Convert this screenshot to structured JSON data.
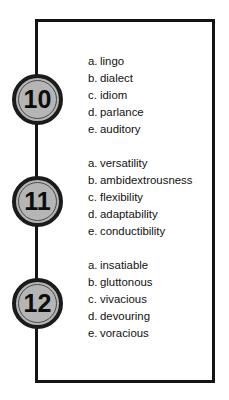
{
  "page": {
    "background_color": "#ffffff",
    "frame_color": "#141414",
    "medallion_fill_color": "#b5b5b5",
    "medallion_ring_color": "#1b1b1b",
    "text_color": "#111111"
  },
  "questions": [
    {
      "number": "10",
      "options": [
        {
          "letter": "a.",
          "text": "lingo"
        },
        {
          "letter": "b.",
          "text": "dialect"
        },
        {
          "letter": "c.",
          "text": "idiom"
        },
        {
          "letter": "d.",
          "text": "parlance"
        },
        {
          "letter": "e.",
          "text": "auditory"
        }
      ]
    },
    {
      "number": "11",
      "options": [
        {
          "letter": "a.",
          "text": "versatility"
        },
        {
          "letter": "b.",
          "text": "ambidextrousness"
        },
        {
          "letter": "c.",
          "text": "flexibility"
        },
        {
          "letter": "d.",
          "text": "adaptability"
        },
        {
          "letter": "e.",
          "text": "conductibility"
        }
      ]
    },
    {
      "number": "12",
      "options": [
        {
          "letter": "a.",
          "text": "insatiable"
        },
        {
          "letter": "b.",
          "text": "gluttonous"
        },
        {
          "letter": "c.",
          "text": "vivacious"
        },
        {
          "letter": "d.",
          "text": "devouring"
        },
        {
          "letter": "e.",
          "text": "voracious"
        }
      ]
    }
  ]
}
